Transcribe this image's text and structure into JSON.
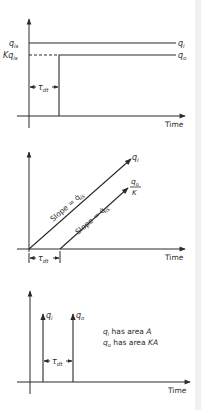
{
  "panels": [
    {
      "name": "step-response",
      "x_axis_label": "Time",
      "y_tick_labels": {
        "upper": "q",
        "upper_sub": "is",
        "lower": "Kq",
        "lower_sub": "is"
      },
      "curve_labels": {
        "input": "q",
        "input_sub": "i",
        "output": "q",
        "output_sub": "o"
      },
      "delay_label": "τ",
      "delay_sub": "dt"
    },
    {
      "name": "ramp-response",
      "x_axis_label": "Time",
      "slope_label_input": "Slope = q̇",
      "slope_label_input_sub": "is",
      "slope_label_output": "Slope = q̇",
      "slope_label_output_sub": "is",
      "curve_labels": {
        "input": "q",
        "input_sub": "i",
        "output_num": "q",
        "output_num_sub": "o",
        "output_den": "K"
      },
      "delay_label": "τ",
      "delay_sub": "dt"
    },
    {
      "name": "impulse-response",
      "x_axis_label": "Time",
      "curve_labels": {
        "input": "q",
        "input_sub": "i",
        "output": "q",
        "output_sub": "o"
      },
      "delay_label": "τ",
      "delay_sub": "dt",
      "notes": [
        {
          "sym": "q",
          "sub": "i",
          "text": " has area ",
          "val": "A"
        },
        {
          "sym": "q",
          "sub": "o",
          "text": " has area ",
          "val": "KA"
        }
      ]
    }
  ]
}
